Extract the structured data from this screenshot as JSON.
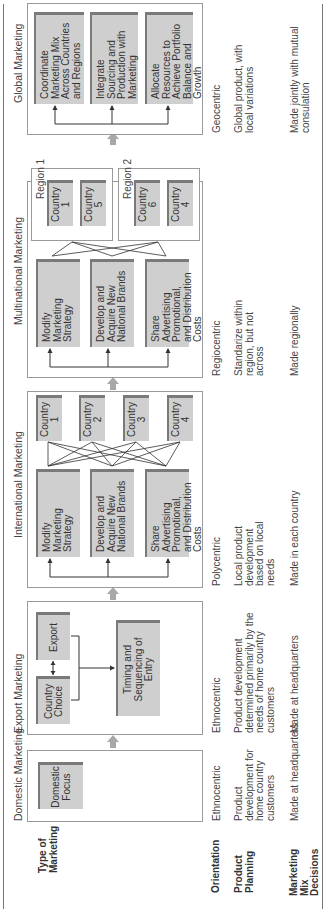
{
  "row_labels": {
    "type_of_marketing": "Type of Marketing",
    "orientation": "Orientation",
    "product_planning": "Product Planning",
    "marketing_mix_decisions": "Marketing Mix Decisions"
  },
  "stages": [
    {
      "title": "Domestic Marketing",
      "boxes": [
        "Domestic Focus"
      ],
      "orientation": "Ethnocentric",
      "product_planning": "Product development for home country customers",
      "marketing_mix_decisions": "Made at headquarters"
    },
    {
      "title": "Export Marketing",
      "boxes": [
        "Country Choice",
        "Export",
        "Timing and Sequencing of Entry"
      ],
      "orientation": "Ethnocentric",
      "product_planning": "Product development determined primarily by the needs of home country customers",
      "marketing_mix_decisions": "Made at headquarters"
    },
    {
      "title": "International Marketing",
      "boxes": [
        "Modify Marketing Strategy",
        "Develop and Acquire New National Brands",
        "Share Advertising Promotional, and Distribution Costs"
      ],
      "countries": [
        "Country 1",
        "Country 2",
        "Country 3",
        "Country 4"
      ],
      "orientation": "Polycentric",
      "product_planning": "Local product development based on local needs",
      "marketing_mix_decisions": "Made in each country"
    },
    {
      "title": "Multinational Marketing",
      "boxes": [
        "Modify Marketing Strategy",
        "Develop and Acquire New National Brands",
        "Share Advertising Promotional, and Distribution Costs"
      ],
      "regions": [
        {
          "label": "Region 1",
          "countries": [
            "Country 1",
            "Country 5"
          ]
        },
        {
          "label": "Region 2",
          "countries": [
            "Country 6",
            "Country 4"
          ]
        }
      ],
      "orientation": "Regiocentric",
      "product_planning": "Standarize within region, but not across",
      "marketing_mix_decisions": "Made regionally"
    },
    {
      "title": "Global Marketing",
      "boxes": [
        "Coordinate Marketing Mix Across Countries and Regions",
        "Integrate Sourcing and Production with Marketing",
        "Allocate Resources to Achieve Portfolio Balance and Growth"
      ],
      "orientation": "Geocentric",
      "product_planning": "Global product, with local variations",
      "marketing_mix_decisions": "Made jointly with mutual consulation"
    }
  ],
  "colors": {
    "box_fill": "#cfcfcf",
    "box_shadow": "#7a7a7a",
    "frame_border": "#9a9a9a",
    "arrow": "#a8a8a8",
    "rule": "#777777"
  }
}
